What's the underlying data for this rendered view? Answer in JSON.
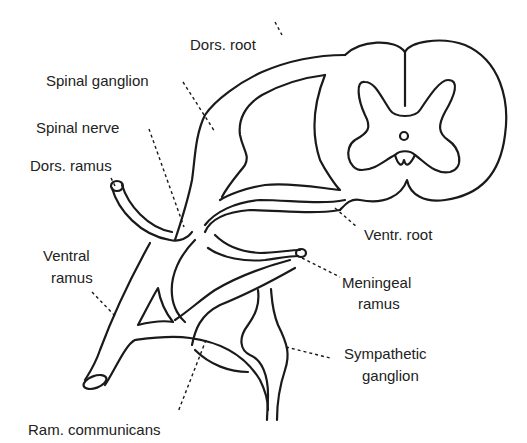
{
  "diagram": {
    "labels": {
      "dors_root": "Dors. root",
      "spinal_ganglion": "Spinal ganglion",
      "spinal_nerve": "Spinal nerve",
      "dors_ramus": "Dors. ramus",
      "ventral_ramus_line1": "Ventral",
      "ventral_ramus_line2": "ramus",
      "ventr_root": "Ventr. root",
      "meningeal_ramus_line1": "Meningeal",
      "meningeal_ramus_line2": "ramus",
      "sympathetic_ganglion_line1": "Sympathetic",
      "sympathetic_ganglion_line2": "ganglion",
      "ram_communicans": "Ram. communicans"
    },
    "colors": {
      "line": "#1a1a1a",
      "text": "#222222",
      "background": "#ffffff"
    }
  }
}
